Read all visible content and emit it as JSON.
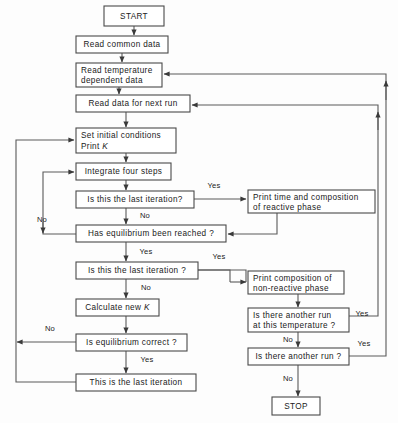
{
  "diagram": {
    "colors": {
      "background": "#fdfdfd",
      "box_fill": "#ffffff",
      "box_stroke": "#4a4a4a",
      "line": "#5a5a5a",
      "text": "#1a1a1a"
    },
    "nodes": [
      {
        "id": "start",
        "shape": "terminator",
        "lines": [
          "START"
        ],
        "x": 104,
        "y": 6,
        "w": 60,
        "h": 20
      },
      {
        "id": "read-common",
        "shape": "process",
        "lines": [
          "Read  common  data"
        ],
        "x": 76,
        "y": 36,
        "w": 92,
        "h": 17
      },
      {
        "id": "read-temp",
        "shape": "process",
        "lines": [
          "Read  temperature",
          "dependent  data"
        ],
        "x": 76,
        "y": 63,
        "w": 86,
        "h": 24
      },
      {
        "id": "read-next",
        "shape": "process",
        "lines": [
          "Read  data  for  next  run"
        ],
        "x": 76,
        "y": 95,
        "w": 114,
        "h": 17
      },
      {
        "id": "set-init",
        "shape": "process",
        "lines": [
          "Set  initial  conditions",
          "Print  K"
        ],
        "x": 76,
        "y": 128,
        "w": 100,
        "h": 25
      },
      {
        "id": "integrate",
        "shape": "process",
        "lines": [
          "Integrate  four  steps"
        ],
        "x": 76,
        "y": 163,
        "w": 95,
        "h": 17
      },
      {
        "id": "last-iter-1",
        "shape": "decision",
        "lines": [
          "Is this the  last  iteration?"
        ],
        "x": 76,
        "y": 191,
        "w": 118,
        "h": 17
      },
      {
        "id": "equil-reach",
        "shape": "decision",
        "lines": [
          "Has  equilibrium  been  reached ?"
        ],
        "x": 76,
        "y": 225,
        "w": 150,
        "h": 17
      },
      {
        "id": "last-iter-2",
        "shape": "decision",
        "lines": [
          "Is this the  last  iteration ?"
        ],
        "x": 76,
        "y": 262,
        "w": 122,
        "h": 17
      },
      {
        "id": "calc-k",
        "shape": "process",
        "lines": [
          "Calculate  new  K"
        ],
        "x": 76,
        "y": 299,
        "w": 83,
        "h": 17
      },
      {
        "id": "equil-correct",
        "shape": "decision",
        "lines": [
          "Is  equilibrium  correct ?"
        ],
        "x": 76,
        "y": 334,
        "w": 111,
        "h": 17
      },
      {
        "id": "this-last",
        "shape": "process",
        "lines": [
          "This  is  the  last  iteration"
        ],
        "x": 76,
        "y": 374,
        "w": 120,
        "h": 17
      },
      {
        "id": "print-react",
        "shape": "process",
        "lines": [
          "Print  time  and  composition",
          "of  reactive  phase"
        ],
        "x": 248,
        "y": 190,
        "w": 127,
        "h": 23
      },
      {
        "id": "print-nonreact",
        "shape": "process",
        "lines": [
          "Print  composition  of",
          "non-reactive  phase"
        ],
        "x": 248,
        "y": 271,
        "w": 96,
        "h": 23
      },
      {
        "id": "another-temp",
        "shape": "decision",
        "lines": [
          "Is  there  another  run",
          "at  this  temperature ?"
        ],
        "x": 248,
        "y": 308,
        "w": 101,
        "h": 24
      },
      {
        "id": "another-run",
        "shape": "decision",
        "lines": [
          "Is  there  another  run ?"
        ],
        "x": 248,
        "y": 348,
        "w": 101,
        "h": 17
      },
      {
        "id": "stop",
        "shape": "terminator",
        "lines": [
          "STOP"
        ],
        "x": 272,
        "y": 397,
        "w": 48,
        "h": 18
      }
    ],
    "edge_labels": [
      {
        "id": "yes-last-iter-1",
        "text": "Yes",
        "x": 214,
        "y": 186
      },
      {
        "id": "no-last-iter-1",
        "text": "No",
        "x": 145,
        "y": 216
      },
      {
        "id": "no-equil-reach",
        "text": "No",
        "x": 42,
        "y": 220
      },
      {
        "id": "yes-equil-reach",
        "text": "Yes",
        "x": 146,
        "y": 252
      },
      {
        "id": "yes-last-iter-2",
        "text": "Yes",
        "x": 219,
        "y": 257
      },
      {
        "id": "no-last-iter-2",
        "text": "No",
        "x": 146,
        "y": 288
      },
      {
        "id": "no-equil-correct",
        "text": "No",
        "x": 50,
        "y": 329
      },
      {
        "id": "yes-equil-correct",
        "text": "Yes",
        "x": 147,
        "y": 360
      },
      {
        "id": "yes-another-temp",
        "text": "Yes",
        "x": 362,
        "y": 314
      },
      {
        "id": "no-another-temp",
        "text": "No",
        "x": 288,
        "y": 340
      },
      {
        "id": "yes-another-run",
        "text": "Yes",
        "x": 364,
        "y": 344
      },
      {
        "id": "no-another-run",
        "text": "No",
        "x": 288,
        "y": 379
      }
    ]
  }
}
